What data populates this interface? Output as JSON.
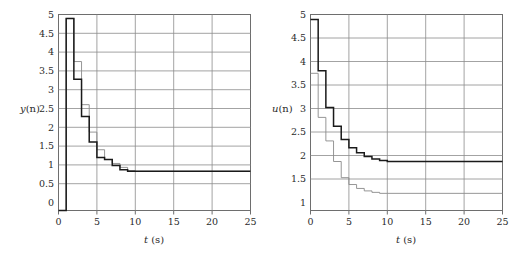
{
  "figure": {
    "background": "#ffffff",
    "grid_color": "#8c8c8c",
    "frame_color": "#6e6e6e",
    "curve_thick_color": "#1a1a1a",
    "curve_thin_color": "#8a8a8a"
  },
  "chart_data": [
    {
      "type": "line",
      "id": "output-response",
      "title": "",
      "xlabel": "t (s)",
      "ylabel": "y(n)",
      "xlabel_var": "t",
      "xlabel_unit": "(s)",
      "ylabel_var": "y",
      "ylabel_arg": "(n)",
      "grid": true,
      "legend": "none",
      "xlim": [
        0,
        25
      ],
      "ylim": [
        0,
        5
      ],
      "xticks": [
        0,
        5,
        10,
        15,
        20,
        25
      ],
      "xtick_labels": [
        "0",
        "5",
        "10",
        "15",
        "20",
        "25"
      ],
      "yticks": [
        0,
        0.5,
        1,
        1.5,
        2,
        2.5,
        3,
        3.5,
        4,
        4.5,
        5
      ],
      "ytick_labels": [
        "0",
        "0.5",
        "1",
        "1.5",
        "2",
        "2.5",
        "3",
        "3.5",
        "4",
        "4.5",
        "5"
      ],
      "step_style": "staircase",
      "series": [
        {
          "name": "y(n) thick",
          "style": "thick-dark",
          "x": [
            0,
            1,
            1,
            2,
            2,
            3,
            3,
            4,
            4,
            5,
            5,
            6,
            6,
            7,
            7,
            8,
            8,
            9,
            9,
            10,
            10,
            25
          ],
          "values": [
            0,
            0,
            4.9,
            4.9,
            3.35,
            3.35,
            2.4,
            2.4,
            1.75,
            1.75,
            1.35,
            1.35,
            1.3,
            1.3,
            1.15,
            1.15,
            1.04,
            1.04,
            1.0,
            1.0,
            1.0,
            1.0
          ]
        },
        {
          "name": "y(n) thin",
          "style": "thin-gray",
          "x": [
            0,
            1,
            1,
            2,
            2,
            3,
            3,
            4,
            4,
            5,
            5,
            6,
            6,
            7,
            7,
            8,
            8,
            9,
            9,
            10,
            10,
            25
          ],
          "values": [
            0,
            0,
            4.9,
            4.9,
            3.8,
            3.8,
            2.7,
            2.7,
            2.0,
            2.0,
            1.55,
            1.55,
            1.3,
            1.3,
            1.2,
            1.2,
            1.1,
            1.1,
            1.02,
            1.02,
            1.0,
            1.0
          ]
        }
      ]
    },
    {
      "type": "line",
      "id": "control-signal",
      "title": "",
      "xlabel": "t (s)",
      "ylabel": "u(n)",
      "xlabel_var": "t",
      "xlabel_unit": "(s)",
      "ylabel_var": "u",
      "ylabel_arg": "(n)",
      "grid": true,
      "legend": "none",
      "xlim": [
        0,
        25
      ],
      "ylim": [
        1,
        5
      ],
      "xticks": [
        0,
        5,
        10,
        15,
        20,
        25
      ],
      "xtick_labels": [
        "0",
        "5",
        "10",
        "15",
        "20",
        "25"
      ],
      "yticks": [
        1,
        1.5,
        2,
        2.5,
        3,
        3.5,
        4,
        4.5,
        5
      ],
      "ytick_labels": [
        "1",
        "1.5",
        "2",
        "2.5",
        "3",
        "3.5",
        "4",
        "4.5",
        "5"
      ],
      "step_style": "staircase",
      "series": [
        {
          "name": "u(n) thick",
          "style": "thick-dark",
          "x": [
            0,
            1,
            1,
            2,
            2,
            3,
            3,
            4,
            4,
            5,
            5,
            6,
            6,
            7,
            7,
            8,
            8,
            9,
            9,
            10,
            10,
            25
          ],
          "values": [
            4.9,
            4.9,
            3.85,
            3.85,
            3.1,
            3.1,
            2.72,
            2.72,
            2.45,
            2.45,
            2.28,
            2.28,
            2.18,
            2.18,
            2.1,
            2.1,
            2.05,
            2.05,
            2.02,
            2.02,
            2.0,
            2.0
          ]
        },
        {
          "name": "u(n) thin",
          "style": "thin-gray",
          "x": [
            0,
            1,
            1,
            2,
            2,
            3,
            3,
            4,
            4,
            5,
            5,
            6,
            6,
            7,
            7,
            8,
            8,
            9,
            9,
            10,
            10,
            25
          ],
          "values": [
            3.8,
            3.8,
            2.9,
            2.9,
            2.42,
            2.42,
            2.0,
            2.0,
            1.67,
            1.67,
            1.53,
            1.53,
            1.45,
            1.45,
            1.4,
            1.4,
            1.37,
            1.37,
            1.35,
            1.35,
            1.35,
            1.35
          ]
        }
      ]
    }
  ]
}
